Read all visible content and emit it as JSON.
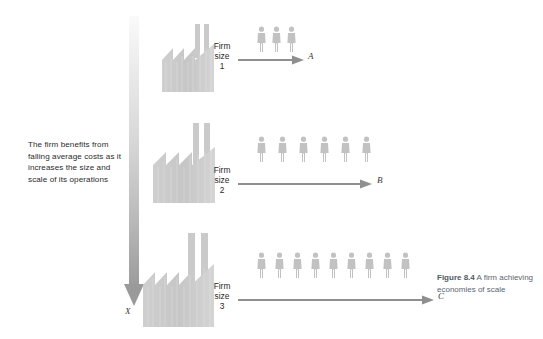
{
  "figure": {
    "intro_text": "The firm benefits from falling average costs as it increases the size and scale of its operations",
    "axis_label": "X",
    "caption_bold": "Figure 8.4",
    "caption_rest": " A firm achieving economies of scale",
    "colors": {
      "factory_fill": "#c9c9c9",
      "person_fill": "#bdbdbd",
      "arrow": "#8f8f8f",
      "gradient_top": "#f2f2f2",
      "gradient_bottom": "#9a9a9a",
      "text": "#2b2b2b",
      "caption": "#5b6670"
    }
  },
  "rows": [
    {
      "firm_word": "Firm",
      "size_word": "size",
      "size_number": "1",
      "people_count": 3,
      "end_label": "A",
      "factory_teeth": 3,
      "factory_width": 58,
      "factory_height": 52,
      "arrow_length": 62
    },
    {
      "firm_word": "Firm",
      "size_word": "size",
      "size_number": "2",
      "people_count": 6,
      "end_label": "B",
      "factory_teeth": 3,
      "factory_width": 68,
      "factory_height": 62,
      "arrow_length": 130
    },
    {
      "firm_word": "Firm",
      "size_word": "size",
      "size_number": "3",
      "people_count": 9,
      "end_label": "C",
      "factory_teeth": 4,
      "factory_width": 78,
      "factory_height": 72,
      "arrow_length": 192
    }
  ]
}
